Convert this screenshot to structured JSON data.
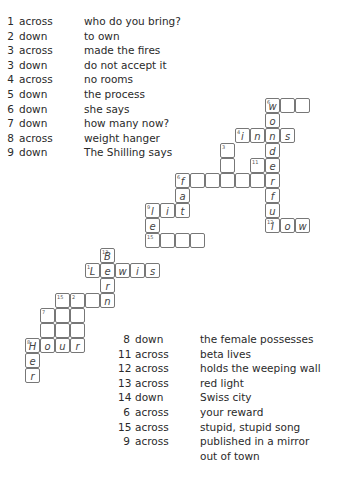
{
  "clues_top": [
    {
      "num": "1",
      "dir": "across",
      "text": "who do you bring?"
    },
    {
      "num": "2",
      "dir": "down",
      "text": "to own"
    },
    {
      "num": "3",
      "dir": "across",
      "text": "made the fires"
    },
    {
      "num": "3",
      "dir": "down",
      "text": "do not accept it"
    },
    {
      "num": "4",
      "dir": "across",
      "text": "no rooms"
    },
    {
      "num": "5",
      "dir": "down",
      "text": "the process"
    },
    {
      "num": "6",
      "dir": "down",
      "text": "she says"
    },
    {
      "num": "7",
      "dir": "down",
      "text": "how many now?"
    },
    {
      "num": "8",
      "dir": "across",
      "text": "weight hanger"
    },
    {
      "num": "9",
      "dir": "down",
      "text": "The Shilling says"
    }
  ],
  "clues_bottom": [
    {
      "num": "8",
      "dir": "down",
      "text": "the female possesses"
    },
    {
      "num": "11",
      "dir": "across",
      "text": "beta lives"
    },
    {
      "num": "12",
      "dir": "across",
      "text": "holds the weeping wall"
    },
    {
      "num": "13",
      "dir": "across",
      "text": "red light"
    },
    {
      "num": "14",
      "dir": "down",
      "text": "Swiss city"
    },
    {
      "num": "6",
      "dir": "across",
      "text": "your reward"
    },
    {
      "num": "15",
      "dir": "across",
      "text": "stupid, stupid song"
    },
    {
      "num": "9",
      "dir": "across",
      "text": "published in a mirror"
    },
    {
      "num": "",
      "dir": "",
      "text": "out of town"
    }
  ],
  "grid": [
    {
      "x": 265,
      "y": 98,
      "n": "6",
      "l": "w"
    },
    {
      "x": 280,
      "y": 98,
      "n": "",
      "l": ""
    },
    {
      "x": 295,
      "y": 98,
      "n": "",
      "l": ""
    },
    {
      "x": 265,
      "y": 113,
      "n": "",
      "l": "o"
    },
    {
      "x": 235,
      "y": 128,
      "n": "4",
      "l": "i"
    },
    {
      "x": 250,
      "y": 128,
      "n": "",
      "l": "n"
    },
    {
      "x": 265,
      "y": 128,
      "n": "",
      "l": "n"
    },
    {
      "x": 280,
      "y": 128,
      "n": "",
      "l": "s"
    },
    {
      "x": 220,
      "y": 143,
      "n": "3",
      "l": ""
    },
    {
      "x": 265,
      "y": 143,
      "n": "",
      "l": "d"
    },
    {
      "x": 220,
      "y": 158,
      "n": "",
      "l": ""
    },
    {
      "x": 250,
      "y": 158,
      "n": "11",
      "l": ""
    },
    {
      "x": 265,
      "y": 158,
      "n": "",
      "l": "e"
    },
    {
      "x": 175,
      "y": 173,
      "n": "6",
      "l": "f"
    },
    {
      "x": 190,
      "y": 173,
      "n": "",
      "l": ""
    },
    {
      "x": 205,
      "y": 173,
      "n": "",
      "l": ""
    },
    {
      "x": 220,
      "y": 173,
      "n": "",
      "l": ""
    },
    {
      "x": 235,
      "y": 173,
      "n": "",
      "l": ""
    },
    {
      "x": 250,
      "y": 173,
      "n": "",
      "l": ""
    },
    {
      "x": 265,
      "y": 173,
      "n": "",
      "l": "r"
    },
    {
      "x": 175,
      "y": 188,
      "n": "",
      "l": "a"
    },
    {
      "x": 265,
      "y": 188,
      "n": "",
      "l": "f"
    },
    {
      "x": 145,
      "y": 203,
      "n": "9",
      "l": "l"
    },
    {
      "x": 160,
      "y": 203,
      "n": "",
      "l": "i"
    },
    {
      "x": 175,
      "y": 203,
      "n": "",
      "l": "t"
    },
    {
      "x": 265,
      "y": 203,
      "n": "",
      "l": "u"
    },
    {
      "x": 145,
      "y": 218,
      "n": "",
      "l": "e"
    },
    {
      "x": 265,
      "y": 218,
      "n": "12",
      "l": "l"
    },
    {
      "x": 280,
      "y": 218,
      "n": "",
      "l": "o"
    },
    {
      "x": 295,
      "y": 218,
      "n": "",
      "l": "w"
    },
    {
      "x": 145,
      "y": 233,
      "n": "15",
      "l": ""
    },
    {
      "x": 160,
      "y": 233,
      "n": "",
      "l": ""
    },
    {
      "x": 175,
      "y": 233,
      "n": "",
      "l": ""
    },
    {
      "x": 190,
      "y": 233,
      "n": "",
      "l": ""
    },
    {
      "x": 100,
      "y": 248,
      "n": "13",
      "l": "B"
    },
    {
      "x": 85,
      "y": 263,
      "n": "1",
      "l": "L"
    },
    {
      "x": 100,
      "y": 263,
      "n": "",
      "l": "e"
    },
    {
      "x": 115,
      "y": 263,
      "n": "",
      "l": "w"
    },
    {
      "x": 130,
      "y": 263,
      "n": "",
      "l": "i"
    },
    {
      "x": 145,
      "y": 263,
      "n": "",
      "l": "s"
    },
    {
      "x": 100,
      "y": 278,
      "n": "",
      "l": "r"
    },
    {
      "x": 55,
      "y": 293,
      "n": "15",
      "l": ""
    },
    {
      "x": 70,
      "y": 293,
      "n": "2",
      "l": ""
    },
    {
      "x": 85,
      "y": 293,
      "n": "",
      "l": ""
    },
    {
      "x": 100,
      "y": 293,
      "n": "",
      "l": "n"
    },
    {
      "x": 40,
      "y": 308,
      "n": "7",
      "l": ""
    },
    {
      "x": 55,
      "y": 308,
      "n": "",
      "l": ""
    },
    {
      "x": 70,
      "y": 308,
      "n": "",
      "l": ""
    },
    {
      "x": 40,
      "y": 323,
      "n": "",
      "l": ""
    },
    {
      "x": 55,
      "y": 323,
      "n": "",
      "l": ""
    },
    {
      "x": 70,
      "y": 323,
      "n": "",
      "l": ""
    },
    {
      "x": 25,
      "y": 338,
      "n": "8",
      "l": "H"
    },
    {
      "x": 40,
      "y": 338,
      "n": "",
      "l": "o"
    },
    {
      "x": 55,
      "y": 338,
      "n": "",
      "l": "u"
    },
    {
      "x": 70,
      "y": 338,
      "n": "",
      "l": "r"
    },
    {
      "x": 25,
      "y": 353,
      "n": "",
      "l": "e"
    },
    {
      "x": 25,
      "y": 368,
      "n": "",
      "l": "r"
    }
  ]
}
